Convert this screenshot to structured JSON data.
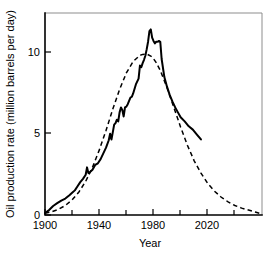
{
  "chart_data": {
    "type": "line",
    "title": "",
    "xlabel": "Year",
    "ylabel": "Oil production rate (million barrels per day)",
    "xlim": [
      1900,
      2060
    ],
    "ylim": [
      0,
      12.3
    ],
    "grid": false,
    "legend_position": "none",
    "x_ticks_major": [
      1900,
      1940,
      1980,
      2020
    ],
    "x_tick_labels": [
      "1900",
      "1940",
      "1980",
      "2020"
    ],
    "x_ticks_minor": [
      1920,
      1960,
      2000,
      2040
    ],
    "y_ticks_major": [
      0,
      5,
      10
    ],
    "y_tick_labels": [
      "0",
      "5",
      "10"
    ],
    "series": [
      {
        "name": "Actual oil production",
        "style": "solid",
        "color": "#000000",
        "x": [
          1900,
          1903,
          1906,
          1909,
          1912,
          1915,
          1918,
          1920,
          1922,
          1924,
          1926,
          1928,
          1930,
          1931,
          1932,
          1933,
          1935,
          1937,
          1939,
          1941,
          1943,
          1945,
          1947,
          1948,
          1949,
          1950,
          1951,
          1952,
          1953,
          1954,
          1955,
          1956,
          1957,
          1958,
          1959,
          1960,
          1961,
          1962,
          1963,
          1964,
          1965,
          1967,
          1969,
          1970,
          1971,
          1972,
          1973,
          1974,
          1975,
          1976,
          1977,
          1978,
          1979,
          1980,
          1981,
          1982,
          1983,
          1984,
          1985,
          1986,
          1988,
          1990,
          1992,
          1994,
          1996,
          1998,
          2000,
          2003,
          2006,
          2009,
          2012,
          2015
        ],
        "y": [
          0.12,
          0.3,
          0.55,
          0.72,
          0.88,
          1.0,
          1.2,
          1.35,
          1.5,
          1.75,
          2.0,
          2.2,
          2.45,
          2.9,
          2.55,
          2.6,
          2.75,
          3.05,
          3.15,
          3.4,
          3.75,
          4.1,
          4.55,
          4.95,
          4.6,
          5.05,
          5.5,
          5.6,
          5.8,
          5.7,
          6.25,
          6.55,
          6.4,
          6.0,
          6.55,
          6.6,
          6.75,
          6.95,
          7.15,
          7.2,
          7.4,
          7.95,
          8.3,
          9.1,
          9.0,
          9.25,
          9.45,
          9.7,
          10.1,
          10.55,
          11.2,
          11.3,
          10.8,
          10.6,
          10.45,
          10.55,
          10.55,
          10.6,
          10.55,
          9.5,
          8.4,
          7.8,
          7.3,
          6.9,
          6.55,
          6.25,
          5.95,
          5.7,
          5.4,
          5.2,
          4.9,
          4.6
        ]
      },
      {
        "name": "Hubbert curve fit",
        "style": "dashed",
        "color": "#000000",
        "x": [
          1900,
          1905,
          1910,
          1915,
          1920,
          1925,
          1930,
          1935,
          1940,
          1945,
          1950,
          1955,
          1960,
          1965,
          1970,
          1972,
          1975,
          1978,
          1980,
          1982,
          1985,
          1990,
          1995,
          2000,
          2005,
          2010,
          2015,
          2020,
          2025,
          2030,
          2035,
          2040,
          2045,
          2050,
          2055,
          2060
        ],
        "y": [
          0.1,
          0.2,
          0.35,
          0.58,
          0.92,
          1.4,
          2.05,
          2.9,
          3.95,
          5.15,
          6.45,
          7.65,
          8.65,
          9.35,
          9.72,
          9.78,
          9.8,
          9.68,
          9.52,
          9.28,
          8.8,
          7.75,
          6.55,
          5.35,
          4.25,
          3.3,
          2.55,
          1.92,
          1.45,
          1.08,
          0.8,
          0.58,
          0.42,
          0.3,
          0.18,
          0.05
        ]
      }
    ]
  }
}
